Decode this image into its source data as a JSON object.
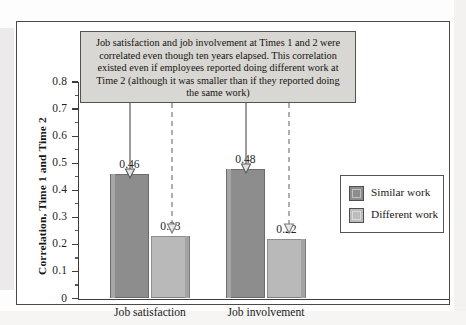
{
  "figure": {
    "annotation": "Job satisfaction and job involvement at Times 1 and 2 were correlated even though ten years elapsed. This correlation existed even if employees reported doing different work at Time 2 (although it was smaller than if they reported doing the same work)"
  },
  "chart_data": {
    "type": "bar",
    "title": "",
    "xlabel": "",
    "ylabel": "Correlation, Time 1 and Time 2",
    "categories": [
      "Job satisfaction",
      "Job involvement"
    ],
    "series": [
      {
        "name": "Similar work",
        "values": [
          0.46,
          0.48
        ],
        "color": "#8d8d8d"
      },
      {
        "name": "Different work",
        "values": [
          0.23,
          0.22
        ],
        "color": "#bcbcbc"
      }
    ],
    "value_labels": [
      [
        "0.46",
        "0.23"
      ],
      [
        "0.48",
        "0.22"
      ]
    ],
    "ylim": [
      0,
      0.8
    ],
    "ytick_labels": [
      "0.8",
      "0.7",
      "0.6",
      "0.5",
      "0.4",
      "0.3",
      "0.2",
      "0.1",
      "0"
    ],
    "ytick_values": [
      0.8,
      0.7,
      0.6,
      0.5,
      0.4,
      0.3,
      0.2,
      0.1,
      0
    ],
    "yminor_values": [
      0.75,
      0.65,
      0.55,
      0.45,
      0.35,
      0.25,
      0.15,
      0.05
    ],
    "grid": false,
    "legend_position": "right"
  }
}
